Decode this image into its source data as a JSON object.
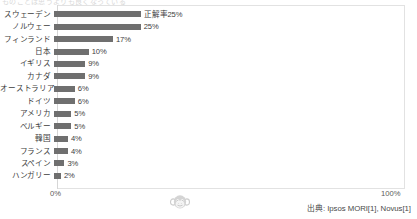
{
  "clipped_title": "ものごとは思うよりも良くなっている",
  "chart_data": {
    "type": "bar",
    "orientation": "horizontal",
    "title": "",
    "subtitle": "",
    "xlabel": "",
    "ylabel": "",
    "grid": false,
    "legend": "none",
    "xlim": [
      0,
      100
    ],
    "xticks": [
      "0%",
      "100%"
    ],
    "value_suffix": "%",
    "categories": [
      "スウェーデン",
      "ノルウェー",
      "フィンランド",
      "日本",
      "イギリス",
      "カナダ",
      "オーストラリア",
      "ドイツ",
      "アメリカ",
      "ベルギー",
      "韓国",
      "フランス",
      "スペイン",
      "ハンガリー"
    ],
    "values": [
      25,
      25,
      17,
      10,
      9,
      9,
      6,
      6,
      5,
      5,
      4,
      4,
      3,
      2
    ],
    "data_labels": [
      "正解率25%",
      "25%",
      "17%",
      "10%",
      "9%",
      "9%",
      "6%",
      "6%",
      "5%",
      "5%",
      "4%",
      "4%",
      "3%",
      "2%"
    ],
    "bar_color": "#6f6f6f",
    "axis_color": "#d6d6d6",
    "text_color": "#3d3d3d"
  },
  "footer": {
    "source": "出典: Ipsos MORI[1], Novus[1]",
    "watermark": "monkey-face-icon"
  }
}
